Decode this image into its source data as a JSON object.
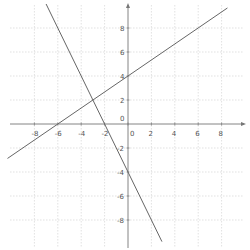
{
  "chart_data": {
    "type": "line",
    "title": "",
    "xlabel": "",
    "ylabel": "",
    "xlim": [
      -10.5,
      10
    ],
    "ylim": [
      -10.5,
      10
    ],
    "grid": true,
    "grid_step": 2,
    "x_ticks": [
      -8,
      -6,
      -4,
      -2,
      0,
      2,
      4,
      6,
      8
    ],
    "y_ticks": [
      8,
      6,
      4,
      2,
      0,
      -2,
      -4,
      -6,
      -8
    ],
    "x_tick_labels": [
      "-8",
      "-6",
      "-4",
      "-2",
      "0",
      "2",
      "4",
      "6",
      "8"
    ],
    "y_tick_labels": [
      "8",
      "6",
      "4",
      "2",
      "0",
      "-2",
      "-4",
      "-6",
      "-8"
    ],
    "origin_label": "0",
    "series": [
      {
        "name": "line-1",
        "equation": "y = (2/3)x + 4",
        "slope": 0.6667,
        "intercept": 4,
        "x": [
          -10.3,
          8.5
        ],
        "y": [
          -2.87,
          9.67
        ],
        "key_points": [
          [
            -6,
            0
          ],
          [
            0,
            4
          ],
          [
            -3,
            2
          ]
        ]
      },
      {
        "name": "line-2",
        "equation": "y = -2x - 4",
        "slope": -2,
        "intercept": -4,
        "x": [
          -7,
          2.9
        ],
        "y": [
          10,
          -9.8
        ],
        "key_points": [
          [
            -2,
            0
          ],
          [
            0,
            -4
          ],
          [
            -3,
            2
          ]
        ]
      }
    ],
    "intersection": [
      -3,
      2
    ],
    "colors": {
      "line": "#666666",
      "axis": "#777777",
      "grid": "#cccccc"
    }
  }
}
